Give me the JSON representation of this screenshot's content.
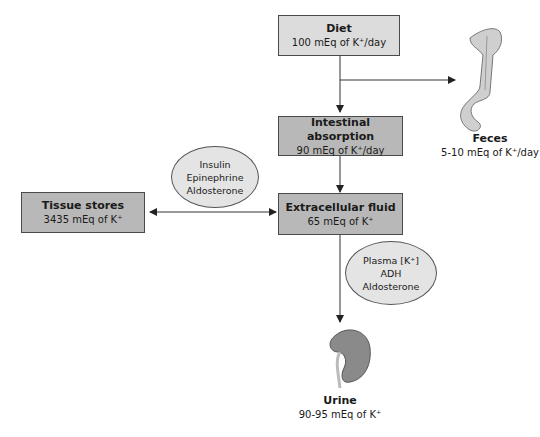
{
  "diagram": {
    "nodes": {
      "diet": {
        "title": "Diet",
        "value": "100 mEq of K⁺/day"
      },
      "intestinal": {
        "title": "Intestinal absorption",
        "value": "90 mEq of K⁺/day"
      },
      "ecf": {
        "title": "Extracellular fluid",
        "value": "65 mEq of K⁺"
      },
      "tissue": {
        "title": "Tissue stores",
        "value": "3435 mEq of K⁺"
      },
      "feces": {
        "title": "Feces",
        "value": "5-10 mEq of K⁺/day"
      },
      "urine": {
        "title": "Urine",
        "value": "90-95 mEq of K⁺"
      }
    },
    "regulators_tissue": [
      "Insulin",
      "Epinephrine",
      "Aldosterone"
    ],
    "regulators_urine": [
      "Plasma [K⁺]",
      "ADH",
      "Aldosterone"
    ],
    "edges": [
      {
        "from": "diet",
        "to": "intestinal"
      },
      {
        "from": "diet",
        "to": "feces"
      },
      {
        "from": "intestinal",
        "to": "ecf"
      },
      {
        "from": "ecf",
        "to": "tissue",
        "bidirectional": true
      },
      {
        "from": "ecf",
        "to": "urine"
      }
    ],
    "icons": {
      "feces": "colon-icon",
      "urine": "kidney-icon"
    }
  }
}
